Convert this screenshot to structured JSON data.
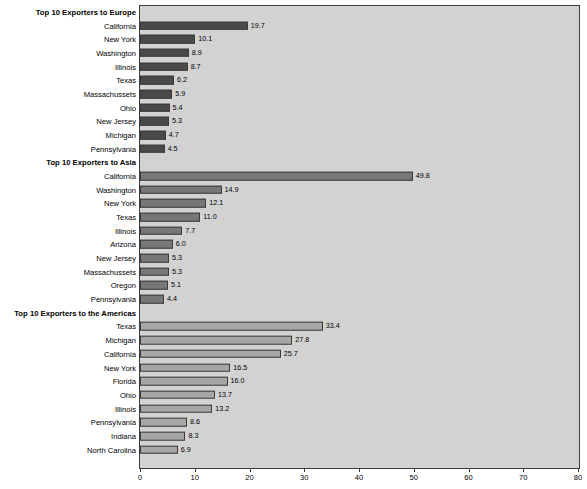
{
  "chart_data": {
    "type": "bar",
    "orientation": "horizontal",
    "title": "",
    "xlabel": "",
    "ylabel": "",
    "xlim": [
      0,
      80
    ],
    "xticks": [
      0,
      10,
      20,
      30,
      40,
      50,
      60,
      70,
      80
    ],
    "grid": false,
    "legend": "none",
    "plot_background": "#d2d2d2",
    "groups": [
      {
        "header": "Top 10 Exporters to Europe",
        "bar_color": "#4a4a4a",
        "categories": [
          "California",
          "New York",
          "Washington",
          "Illinois",
          "Texas",
          "Massachussets",
          "Ohio",
          "New Jersey",
          "Michigan",
          "Pennsylvania"
        ],
        "values": [
          19.7,
          10.1,
          8.9,
          8.7,
          6.2,
          5.9,
          5.4,
          5.3,
          4.7,
          4.5
        ],
        "labels": [
          "19.7",
          "10.1",
          "8.9",
          "8.7",
          "6.2",
          "5.9",
          "5.4",
          "5.3",
          "4.7",
          "4.5"
        ]
      },
      {
        "header": "Top 10 Exporters to Asia",
        "bar_color": "#777777",
        "categories": [
          "California",
          "Washington",
          "New York",
          "Texas",
          "Illinois",
          "Arizona",
          "New Jersey",
          "Massachussets",
          "Oregon",
          "Pennsylvania"
        ],
        "values": [
          49.8,
          14.9,
          12.1,
          11.0,
          7.7,
          6.0,
          5.3,
          5.3,
          5.1,
          4.4
        ],
        "labels": [
          "49.8",
          "14.9",
          "12.1",
          "11.0",
          "7.7",
          "6.0",
          "5.3",
          "5.3",
          "5.1",
          "4.4"
        ]
      },
      {
        "header": "Top 10 Exporters to the Americas",
        "bar_color": "#a6a6a6",
        "categories": [
          "Texas",
          "Michigan",
          "California",
          "New York",
          "Florida",
          "Ohio",
          "Illinois",
          "Pennsylvania",
          "Indiana",
          "North Carolina"
        ],
        "values": [
          33.4,
          27.8,
          25.7,
          16.5,
          16.0,
          13.7,
          13.2,
          8.6,
          8.3,
          6.9
        ],
        "labels": [
          "33.4",
          "27.8",
          "25.7",
          "16.5",
          "16.0",
          "13.7",
          "13.2",
          "8.6",
          "8.3",
          "6.9"
        ]
      }
    ]
  }
}
